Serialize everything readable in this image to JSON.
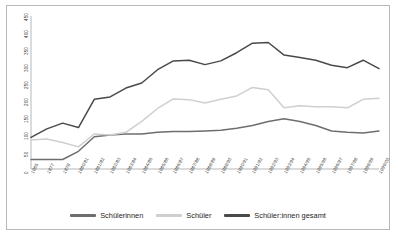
{
  "chart_data": {
    "type": "line",
    "title": "",
    "xlabel": "",
    "ylabel": "",
    "ylim": [
      0,
      450
    ],
    "grid": false,
    "legend_position": "bottom",
    "y_ticks": [
      0,
      50,
      100,
      150,
      200,
      250,
      300,
      350,
      400,
      450
    ],
    "categories": [
      "1965",
      "1877",
      "1878",
      "1880/81",
      "1881/82",
      "1982/83",
      "1983/84",
      "1984/85",
      "1985/86",
      "1986/87",
      "1987/88",
      "1988/89",
      "1989/90",
      "1990/91",
      "1991/92",
      "1992/93",
      "1993/94",
      "1994/95",
      "1995/96",
      "1996/97",
      "1997/98",
      "1998/99",
      "1999/00"
    ],
    "series": [
      {
        "name": "Schülerinnen",
        "color": "#6e6e6e",
        "values": [
          28,
          28,
          28,
          52,
          95,
          100,
          103,
          103,
          108,
          110,
          110,
          112,
          114,
          120,
          128,
          140,
          148,
          140,
          128,
          112,
          108,
          106,
          112
        ]
      },
      {
        "name": "Schüler",
        "color": "#cfcfcf",
        "values": [
          85,
          88,
          78,
          65,
          103,
          100,
          108,
          140,
          178,
          206,
          204,
          194,
          205,
          215,
          240,
          233,
          180,
          186,
          183,
          183,
          180,
          205,
          208
        ]
      },
      {
        "name": "Schüler:innen gesamt",
        "color": "#4a4a4a",
        "values": [
          93,
          118,
          135,
          122,
          205,
          212,
          238,
          253,
          292,
          318,
          320,
          307,
          318,
          342,
          370,
          372,
          335,
          328,
          320,
          305,
          298,
          320,
          295
        ]
      }
    ]
  },
  "legend": {
    "items": [
      {
        "label": "Schülerinnen",
        "color": "#6e6e6e"
      },
      {
        "label": "Schüler",
        "color": "#cfcfcf"
      },
      {
        "label": "Schüler:innen gesamt",
        "color": "#4a4a4a"
      }
    ]
  },
  "axes": {
    "y_axis_color": "#9a9a9a",
    "x_axis_color": "#9a9a9a"
  }
}
